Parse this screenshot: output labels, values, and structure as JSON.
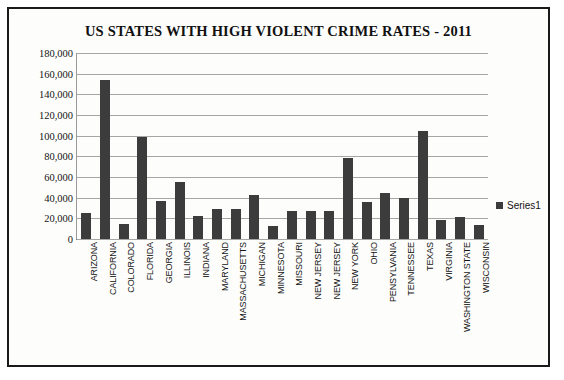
{
  "chart_data": {
    "type": "bar",
    "title": "US STATES WITH HIGH VIOLENT CRIME RATES - 2011",
    "xlabel": "",
    "ylabel": "",
    "ylim": [
      0,
      180000
    ],
    "ytick_step": 20000,
    "ytick_labels": [
      "180,000",
      "160,000",
      "140,000",
      "120,000",
      "100,000",
      "80,000",
      "60,000",
      "40,000",
      "20,000",
      "0"
    ],
    "ytick_values": [
      180000,
      160000,
      140000,
      120000,
      100000,
      80000,
      60000,
      40000,
      20000,
      0
    ],
    "grid": true,
    "legend_position": "right",
    "legend": [
      "Series1"
    ],
    "categories": [
      "ARIZONA",
      "CALIFORNIA",
      "COLORADO",
      "FLORIDA",
      "GEORGIA",
      "ILLINOIS",
      "INDIANA",
      "MARYLAND",
      "MASSACHUSETTS",
      "MICHIGAN",
      "MINNESOTA",
      "MISSOURI",
      "NEW JERSEY",
      "NEW JERSEY",
      "NEW YORK",
      "OHIO",
      "PENSYLVANIA",
      "TENNESSEE",
      "TEXAS",
      "VIRGINIA",
      "WASHINGTON STATE",
      "WISCONSIN"
    ],
    "series": [
      {
        "name": "Series1",
        "color": "#3c3c3c",
        "values": [
          25000,
          154000,
          15000,
          99000,
          37000,
          55000,
          22000,
          29000,
          29000,
          43000,
          13000,
          27000,
          27000,
          27000,
          78000,
          36000,
          45000,
          40000,
          105000,
          18000,
          21000,
          14000
        ]
      }
    ]
  },
  "colors": {
    "bar": "#3c3c3c",
    "frame_border": "#1a1a1a",
    "gridline": "#a6a6a6",
    "background": "#fdfdfc",
    "text": "#111111"
  }
}
